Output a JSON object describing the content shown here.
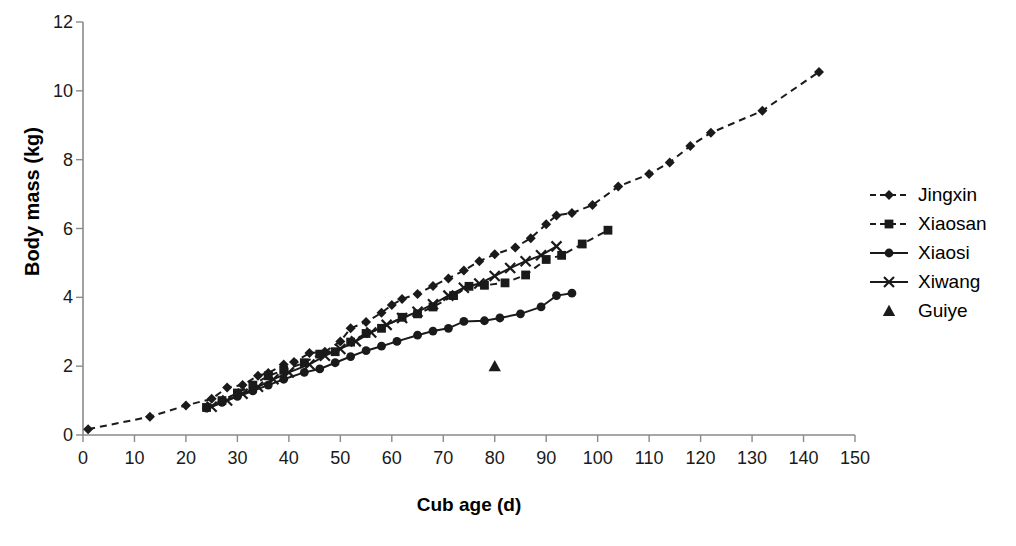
{
  "chart_data": {
    "type": "line",
    "title": "",
    "xlabel": "Cub age (d)",
    "ylabel": "Body mass (kg)",
    "xlim": [
      0,
      150
    ],
    "ylim": [
      0,
      12
    ],
    "xticks": [
      0,
      10,
      20,
      30,
      40,
      50,
      60,
      70,
      80,
      90,
      100,
      110,
      120,
      130,
      140,
      150
    ],
    "yticks": [
      0,
      2,
      4,
      6,
      8,
      10,
      12
    ],
    "grid": false,
    "legend_position": "right",
    "series": [
      {
        "name": "Jingxin",
        "marker": "diamond",
        "line": "dashed",
        "color": "#1a1a1a",
        "points": [
          [
            1,
            0.17
          ],
          [
            13,
            0.53
          ],
          [
            20,
            0.86
          ],
          [
            25,
            1.05
          ],
          [
            28,
            1.38
          ],
          [
            31,
            1.45
          ],
          [
            34,
            1.72
          ],
          [
            36,
            1.8
          ],
          [
            39,
            2.05
          ],
          [
            41,
            2.12
          ],
          [
            44,
            2.38
          ],
          [
            47,
            2.42
          ],
          [
            50,
            2.72
          ],
          [
            52,
            3.1
          ],
          [
            55,
            3.28
          ],
          [
            58,
            3.55
          ],
          [
            60,
            3.78
          ],
          [
            62,
            3.95
          ],
          [
            65,
            4.1
          ],
          [
            68,
            4.33
          ],
          [
            71,
            4.55
          ],
          [
            74,
            4.78
          ],
          [
            77,
            5.05
          ],
          [
            80,
            5.25
          ],
          [
            84,
            5.45
          ],
          [
            87,
            5.72
          ],
          [
            90,
            6.12
          ],
          [
            92,
            6.38
          ],
          [
            95,
            6.45
          ],
          [
            99,
            6.68
          ],
          [
            104,
            7.22
          ],
          [
            110,
            7.58
          ],
          [
            114,
            7.92
          ],
          [
            118,
            8.4
          ],
          [
            122,
            8.78
          ],
          [
            132,
            9.42
          ],
          [
            143,
            10.55
          ]
        ]
      },
      {
        "name": "Xiaosan",
        "marker": "square",
        "line": "dashed",
        "color": "#1a1a1a",
        "points": [
          [
            24,
            0.8
          ],
          [
            27,
            1.0
          ],
          [
            30,
            1.22
          ],
          [
            33,
            1.45
          ],
          [
            36,
            1.72
          ],
          [
            39,
            1.88
          ],
          [
            43,
            2.1
          ],
          [
            46,
            2.35
          ],
          [
            49,
            2.42
          ],
          [
            52,
            2.7
          ],
          [
            55,
            2.95
          ],
          [
            58,
            3.1
          ],
          [
            62,
            3.42
          ],
          [
            65,
            3.52
          ],
          [
            68,
            3.72
          ],
          [
            72,
            4.05
          ],
          [
            75,
            4.32
          ],
          [
            78,
            4.35
          ],
          [
            82,
            4.42
          ],
          [
            86,
            4.65
          ],
          [
            90,
            5.1
          ],
          [
            93,
            5.22
          ],
          [
            97,
            5.55
          ],
          [
            102,
            5.95
          ]
        ]
      },
      {
        "name": "Xiaosi",
        "marker": "circle",
        "line": "solid",
        "color": "#1a1a1a",
        "points": [
          [
            24,
            0.78
          ],
          [
            27,
            0.95
          ],
          [
            30,
            1.12
          ],
          [
            33,
            1.28
          ],
          [
            36,
            1.45
          ],
          [
            39,
            1.62
          ],
          [
            43,
            1.82
          ],
          [
            46,
            1.92
          ],
          [
            49,
            2.1
          ],
          [
            52,
            2.28
          ],
          [
            55,
            2.45
          ],
          [
            58,
            2.58
          ],
          [
            61,
            2.72
          ],
          [
            65,
            2.9
          ],
          [
            68,
            3.02
          ],
          [
            71,
            3.1
          ],
          [
            74,
            3.3
          ],
          [
            78,
            3.32
          ],
          [
            81,
            3.4
          ],
          [
            85,
            3.52
          ],
          [
            89,
            3.72
          ],
          [
            92,
            4.05
          ],
          [
            95,
            4.12
          ]
        ]
      },
      {
        "name": "Xiwang",
        "marker": "cross",
        "line": "solid",
        "color": "#1a1a1a",
        "points": [
          [
            25,
            0.82
          ],
          [
            28,
            1.0
          ],
          [
            31,
            1.2
          ],
          [
            34,
            1.4
          ],
          [
            37,
            1.62
          ],
          [
            40,
            1.82
          ],
          [
            44,
            2.05
          ],
          [
            47,
            2.3
          ],
          [
            50,
            2.5
          ],
          [
            53,
            2.72
          ],
          [
            56,
            2.98
          ],
          [
            59,
            3.2
          ],
          [
            62,
            3.4
          ],
          [
            65,
            3.58
          ],
          [
            68,
            3.8
          ],
          [
            71,
            4.05
          ],
          [
            74,
            4.28
          ],
          [
            77,
            4.4
          ],
          [
            80,
            4.62
          ],
          [
            83,
            4.85
          ],
          [
            86,
            5.05
          ],
          [
            89,
            5.22
          ],
          [
            92,
            5.48
          ]
        ]
      },
      {
        "name": "Guiye",
        "marker": "triangle",
        "line": "none",
        "color": "#1a1a1a",
        "points": [
          [
            80,
            2.0
          ]
        ]
      }
    ]
  },
  "axes": {
    "y_title": "Body mass (kg)",
    "x_title": "Cub age (d)"
  },
  "legend": {
    "items": [
      {
        "label": "Jingxin"
      },
      {
        "label": "Xiaosan"
      },
      {
        "label": "Xiaosi"
      },
      {
        "label": "Xiwang"
      },
      {
        "label": "Guiye"
      }
    ]
  }
}
